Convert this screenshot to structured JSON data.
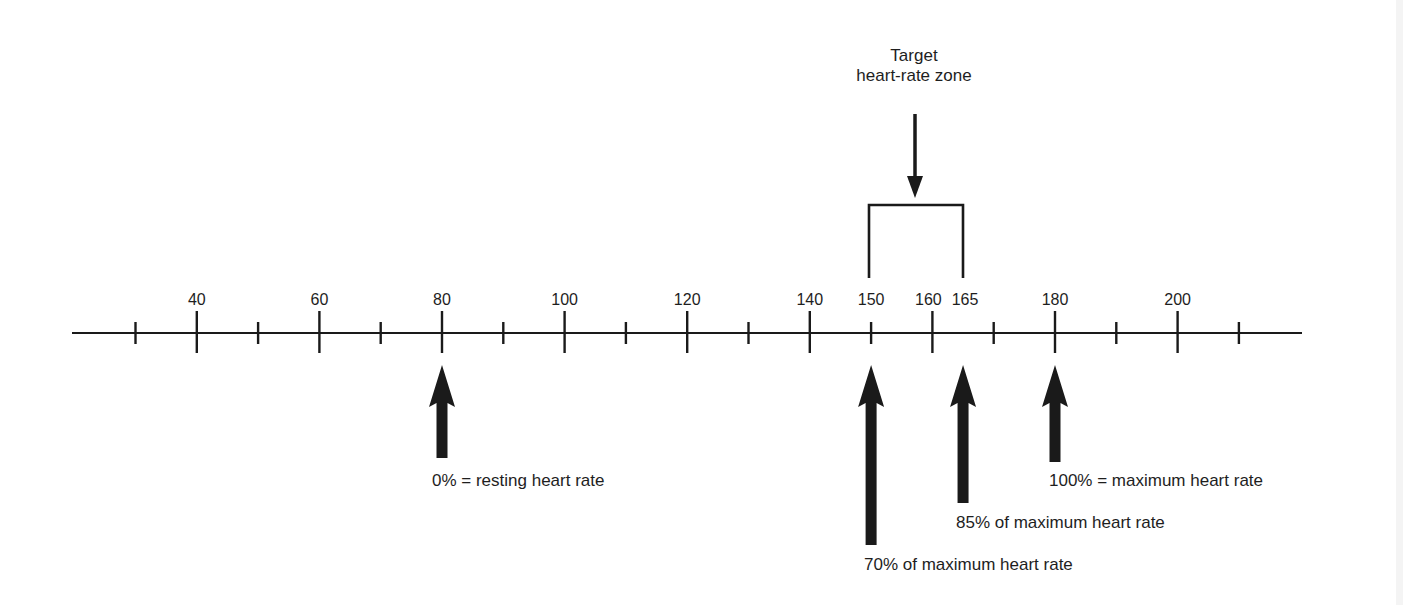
{
  "title": {
    "line1": "Target",
    "line2": "heart-rate zone"
  },
  "axis": {
    "unit": "heart rate (beats per minute)",
    "min": 30,
    "max": 210,
    "minor_step": 10,
    "tick_labels": [
      {
        "value": 40,
        "text": "40"
      },
      {
        "value": 60,
        "text": "60"
      },
      {
        "value": 80,
        "text": "80"
      },
      {
        "value": 100,
        "text": "100"
      },
      {
        "value": 120,
        "text": "120"
      },
      {
        "value": 140,
        "text": "140"
      },
      {
        "value": 150,
        "text": "150"
      },
      {
        "value": 160,
        "text": "160"
      },
      {
        "value": 165,
        "text": "165"
      },
      {
        "value": 180,
        "text": "180"
      },
      {
        "value": 200,
        "text": "200"
      }
    ]
  },
  "target_zone": {
    "low": 150,
    "high": 165
  },
  "markers": [
    {
      "value": 80,
      "label": "0% = resting heart rate"
    },
    {
      "value": 150,
      "label": "70% of maximum heart rate"
    },
    {
      "value": 165,
      "label": "85% of maximum heart rate"
    },
    {
      "value": 180,
      "label": "100% = maximum heart rate"
    }
  ],
  "colors": {
    "ink": "#1a1a1a",
    "background": "#ffffff"
  }
}
